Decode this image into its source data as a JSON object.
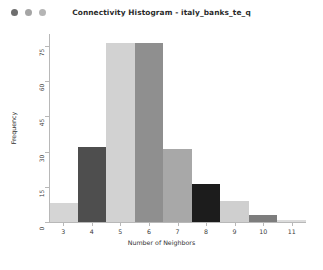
{
  "window": {
    "title": "Connectivity Histogram - italy_banks_te_q",
    "traffic_lights": [
      {
        "name": "close-button",
        "color": "#6e6e6e"
      },
      {
        "name": "minimize-button",
        "color": "#a5a5a5"
      },
      {
        "name": "maximize-button",
        "color": "#b5b5b5"
      }
    ],
    "background": "#ffffff"
  },
  "chart_data": {
    "type": "bar",
    "title": "Connectivity Histogram - italy_banks_te_q",
    "xlabel": "Number of Neighbors",
    "ylabel": "Frequency",
    "categories": [
      "3",
      "4",
      "5",
      "6",
      "7",
      "8",
      "9",
      "10",
      "11"
    ],
    "values": [
      8,
      32,
      76,
      76,
      31,
      16,
      9,
      3,
      1
    ],
    "bar_colors": [
      "#d5d5d5",
      "#4e4e4e",
      "#d2d2d2",
      "#8f8f8f",
      "#a8a8a8",
      "#1c1c1c",
      "#cfcfcf",
      "#7d7d7d",
      "#dcdcdc"
    ],
    "xlim": [
      2.5,
      11.5
    ],
    "ylim": [
      0,
      80
    ],
    "xticks": [
      "3",
      "4",
      "5",
      "6",
      "7",
      "8",
      "9",
      "10",
      "11"
    ],
    "yticks": [
      "0",
      "15",
      "30",
      "45",
      "60",
      "75"
    ],
    "ytick_values": [
      0,
      15,
      30,
      45,
      60,
      75
    ],
    "grid": false,
    "legend": null,
    "axis_color": "#b8b8b8"
  }
}
